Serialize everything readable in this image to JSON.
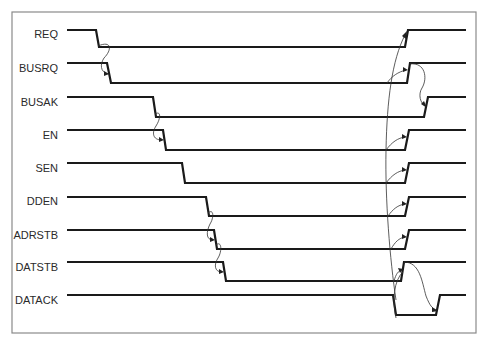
{
  "diagram": {
    "type": "timing-diagram",
    "frame": {
      "x": 12,
      "y": 12,
      "width": 464,
      "height": 321,
      "color": "#8a8a8a"
    },
    "wave_color": "#1a1a1a",
    "signals": [
      {
        "name": "REQ",
        "label_y": 38,
        "high": 30,
        "low": 47,
        "start": 67,
        "fall": [
          96,
          99
        ],
        "rise": [
          405,
          408
        ],
        "end": 466
      },
      {
        "name": "BUSRQ",
        "label_y": 72,
        "high": 63,
        "low": 83,
        "start": 67,
        "fall": [
          107,
          111
        ],
        "rise": [
          407,
          410
        ],
        "end": 466
      },
      {
        "name": "BUSAK",
        "label_y": 106,
        "high": 97,
        "low": 117,
        "start": 67,
        "fall": [
          153,
          156
        ],
        "rise": [
          424,
          428
        ],
        "end": 466
      },
      {
        "name": "EN",
        "label_y": 139,
        "high": 130,
        "low": 150,
        "start": 67,
        "fall": [
          163,
          166
        ],
        "rise": [
          405,
          409
        ],
        "end": 466
      },
      {
        "name": "SEN",
        "label_y": 172,
        "high": 163,
        "low": 183,
        "start": 67,
        "fall": [
          182,
          185
        ],
        "rise": [
          405,
          409
        ],
        "end": 466
      },
      {
        "name": "DDEN",
        "label_y": 205,
        "high": 197,
        "low": 216,
        "start": 67,
        "fall": [
          206,
          209
        ],
        "rise": [
          405,
          409
        ],
        "end": 466
      },
      {
        "name": "ADRSTB",
        "label_y": 239,
        "high": 230,
        "low": 249,
        "start": 67,
        "fall": [
          214,
          217
        ],
        "rise": [
          405,
          409
        ],
        "end": 466
      },
      {
        "name": "DATSTB",
        "label_y": 271,
        "high": 262,
        "low": 281,
        "start": 67,
        "fall": [
          223,
          226
        ],
        "rise": [
          401,
          404
        ],
        "end": 466
      }
    ],
    "datack": {
      "name": "DATACK",
      "label_y": 304,
      "idle": 295,
      "active": 315,
      "start": 67,
      "fall": [
        393,
        396
      ],
      "rise": [
        436,
        440
      ],
      "end": 466
    },
    "causality_arrows": [
      {
        "from": "REQ fall",
        "to": "BUSRQ fall"
      },
      {
        "from": "BUSRQ fall",
        "to": "BUSAK fall"
      },
      {
        "from": "BUSAK fall",
        "to": "EN fall"
      },
      {
        "from": "DDEN fall",
        "to": "ADRSTB fall"
      },
      {
        "from": "ADRSTB fall",
        "to": "DATSTB fall"
      },
      {
        "from": "DATSTB fall",
        "to": "DATACK fall"
      },
      {
        "from": "DATACK fall",
        "to": "REQ rise, EN rise, SEN rise, DDEN rise, ADRSTB rise, DATSTB rise"
      },
      {
        "from": "REQ rise",
        "to": "BUSRQ rise"
      },
      {
        "from": "BUSRQ rise",
        "to": "BUSAK rise"
      },
      {
        "from": "DATSTB rise",
        "to": "DATACK rise"
      }
    ]
  }
}
